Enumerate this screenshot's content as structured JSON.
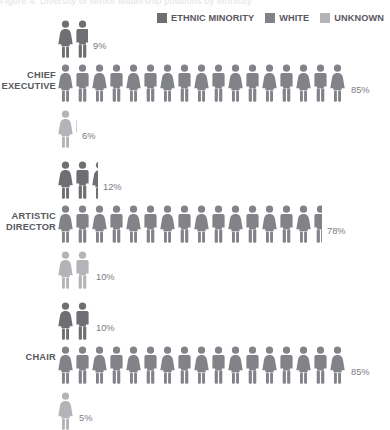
{
  "title_strip": "Figure 4: Diversity of senior leadership positions by ethnicity",
  "colors": {
    "ethnic_minority": "#6e6e73",
    "white": "#828289",
    "unknown": "#b4b4b8",
    "label_text": "#58585e",
    "value_text": "#7b7b82",
    "background": "#ffffff"
  },
  "legend": {
    "position": "top-right",
    "items": [
      {
        "label": "ETHNIC MINORITY",
        "color": "#6e6e73",
        "swatch": "square-swatch"
      },
      {
        "label": "WHITE",
        "color": "#828289",
        "swatch": "square-swatch"
      },
      {
        "label": "UNKNOWN",
        "color": "#b4b4b8",
        "swatch": "square-swatch"
      }
    ]
  },
  "chart_data": {
    "type": "bar",
    "subtype": "pictogram",
    "title": "Figure 4: Diversity of senior leadership positions by ethnicity",
    "xlabel": "",
    "ylabel": "",
    "unit": "percent",
    "icon_value": 5,
    "icon": "person-figure",
    "grid": false,
    "legend_position": "top-right",
    "categories": [
      "CHIEF EXECUTIVE",
      "ARTISTIC DIRECTOR",
      "CHAIR"
    ],
    "series": [
      {
        "name": "ETHNIC MINORITY",
        "color": "#6e6e73",
        "values": [
          9,
          12,
          10
        ]
      },
      {
        "name": "WHITE",
        "color": "#828289",
        "values": [
          85,
          78,
          85
        ]
      },
      {
        "name": "UNKNOWN",
        "color": "#b4b4b8",
        "values": [
          6,
          10,
          5
        ]
      }
    ]
  },
  "groups": [
    {
      "label_line1": "CHIEF",
      "label_line2": "EXECUTIVE",
      "rows": [
        {
          "series": "ETHNIC MINORITY",
          "value": 9,
          "value_label": "9%",
          "full_icons": 1,
          "partial": 0.8,
          "color": "#6e6e73"
        },
        {
          "series": "WHITE",
          "value": 85,
          "value_label": "85%",
          "full_icons": 17,
          "partial": 0,
          "color": "#828289"
        },
        {
          "series": "UNKNOWN",
          "value": 6,
          "value_label": "6%",
          "full_icons": 1,
          "partial": 0.2,
          "color": "#b4b4b8"
        }
      ]
    },
    {
      "label_line1": "ARTISTIC",
      "label_line2": "DIRECTOR",
      "rows": [
        {
          "series": "ETHNIC MINORITY",
          "value": 12,
          "value_label": "12%",
          "full_icons": 2,
          "partial": 0.4,
          "color": "#6e6e73"
        },
        {
          "series": "WHITE",
          "value": 78,
          "value_label": "78%",
          "full_icons": 15,
          "partial": 0.6,
          "color": "#828289"
        },
        {
          "series": "UNKNOWN",
          "value": 10,
          "value_label": "10%",
          "full_icons": 2,
          "partial": 0,
          "color": "#b4b4b8"
        }
      ]
    },
    {
      "label_line1": "CHAIR",
      "label_line2": "",
      "rows": [
        {
          "series": "ETHNIC MINORITY",
          "value": 10,
          "value_label": "10%",
          "full_icons": 2,
          "partial": 0,
          "color": "#6e6e73"
        },
        {
          "series": "WHITE",
          "value": 85,
          "value_label": "85%",
          "full_icons": 17,
          "partial": 0,
          "color": "#828289"
        },
        {
          "series": "UNKNOWN",
          "value": 5,
          "value_label": "5%",
          "full_icons": 1,
          "partial": 0,
          "color": "#b4b4b8"
        }
      ]
    }
  ]
}
